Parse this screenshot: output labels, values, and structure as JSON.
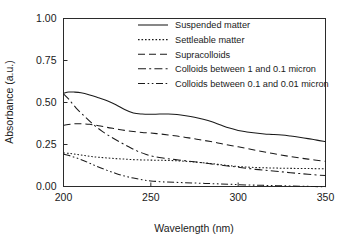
{
  "chart_data": {
    "type": "line",
    "title": "",
    "xlabel": "Wavelength (nm)",
    "ylabel": "Absorbance (a.u.)",
    "xlim": [
      200,
      350
    ],
    "ylim": [
      0.0,
      1.0
    ],
    "xticks": [
      "200",
      "250",
      "300",
      "350"
    ],
    "xtick_values": [
      200,
      250,
      300,
      350
    ],
    "yticks": [
      "0.00",
      "0.25",
      "0.50",
      "0.75",
      "1.00"
    ],
    "ytick_values": [
      0.0,
      0.25,
      0.5,
      0.75,
      1.0
    ],
    "grid": false,
    "legend_position": "top-right",
    "series": [
      {
        "name": "Suspended matter",
        "style": "solid",
        "dasharray": "",
        "x": [
          200,
          203,
          206,
          210,
          215,
          220,
          225,
          230,
          235,
          240,
          245,
          250,
          255,
          260,
          265,
          270,
          275,
          280,
          285,
          290,
          295,
          300,
          305,
          310,
          315,
          320,
          325,
          330,
          335,
          340,
          345,
          350
        ],
        "y": [
          0.555,
          0.562,
          0.562,
          0.558,
          0.545,
          0.528,
          0.51,
          0.487,
          0.458,
          0.437,
          0.431,
          0.43,
          0.431,
          0.431,
          0.428,
          0.421,
          0.412,
          0.4,
          0.385,
          0.366,
          0.348,
          0.334,
          0.325,
          0.318,
          0.313,
          0.31,
          0.306,
          0.3,
          0.293,
          0.285,
          0.276,
          0.268
        ]
      },
      {
        "name": "Settleable matter",
        "style": "dotted",
        "dasharray": "1.6 1.9",
        "x": [
          200,
          204,
          208,
          212,
          216,
          220,
          225,
          230,
          235,
          240,
          245,
          250,
          255,
          260,
          265,
          270,
          275,
          280,
          285,
          290,
          295,
          300,
          310,
          320,
          330,
          340,
          350
        ],
        "y": [
          0.2,
          0.196,
          0.19,
          0.184,
          0.178,
          0.174,
          0.17,
          0.166,
          0.163,
          0.16,
          0.158,
          0.157,
          0.156,
          0.155,
          0.153,
          0.15,
          0.146,
          0.141,
          0.136,
          0.13,
          0.124,
          0.119,
          0.113,
          0.11,
          0.108,
          0.107,
          0.105
        ]
      },
      {
        "name": "Supracolloids",
        "style": "dashed",
        "dasharray": "7 4",
        "x": [
          200,
          205,
          210,
          215,
          220,
          225,
          230,
          235,
          240,
          245,
          250,
          255,
          260,
          265,
          270,
          275,
          280,
          285,
          290,
          295,
          300,
          310,
          320,
          330,
          340,
          350
        ],
        "y": [
          0.365,
          0.372,
          0.374,
          0.37,
          0.362,
          0.352,
          0.343,
          0.334,
          0.327,
          0.322,
          0.318,
          0.313,
          0.307,
          0.3,
          0.292,
          0.284,
          0.275,
          0.266,
          0.256,
          0.246,
          0.236,
          0.216,
          0.196,
          0.178,
          0.163,
          0.15
        ]
      },
      {
        "name": "Colloids between 1 and 0.1 micron",
        "style": "dash-dot",
        "dasharray": "8 3.2 2 3.2",
        "x": [
          200,
          203,
          207,
          212,
          217,
          222,
          227,
          232,
          237,
          242,
          247,
          252,
          258,
          264,
          270,
          276,
          282,
          288,
          294,
          300,
          310,
          320,
          330,
          340,
          350
        ],
        "y": [
          0.552,
          0.52,
          0.47,
          0.418,
          0.37,
          0.33,
          0.296,
          0.266,
          0.238,
          0.212,
          0.192,
          0.178,
          0.168,
          0.16,
          0.153,
          0.146,
          0.138,
          0.13,
          0.122,
          0.115,
          0.102,
          0.092,
          0.082,
          0.073,
          0.065
        ]
      },
      {
        "name": "Colloids between 0.1 and 0.01 micron",
        "style": "dash-dot-dot",
        "dasharray": "7 2.6 1.6 2.6 1.6 2.6",
        "x": [
          200,
          204,
          208,
          212,
          216,
          220,
          225,
          230,
          235,
          240,
          245,
          250,
          258,
          266,
          274,
          282,
          290,
          298,
          306,
          314,
          322,
          330,
          340,
          350
        ],
        "y": [
          0.192,
          0.182,
          0.168,
          0.152,
          0.134,
          0.116,
          0.096,
          0.078,
          0.062,
          0.05,
          0.04,
          0.033,
          0.027,
          0.024,
          0.021,
          0.018,
          0.015,
          0.012,
          0.009,
          0.007,
          0.005,
          0.003,
          0.001,
          -0.002
        ]
      }
    ]
  },
  "legend": {
    "items": [
      {
        "label": "Suspended matter"
      },
      {
        "label": "Settleable matter"
      },
      {
        "label": "Supracolloids"
      },
      {
        "label": "Colloids between 1 and 0.1 micron"
      },
      {
        "label": "Colloids between 0.1 and 0.01 micron"
      }
    ]
  }
}
